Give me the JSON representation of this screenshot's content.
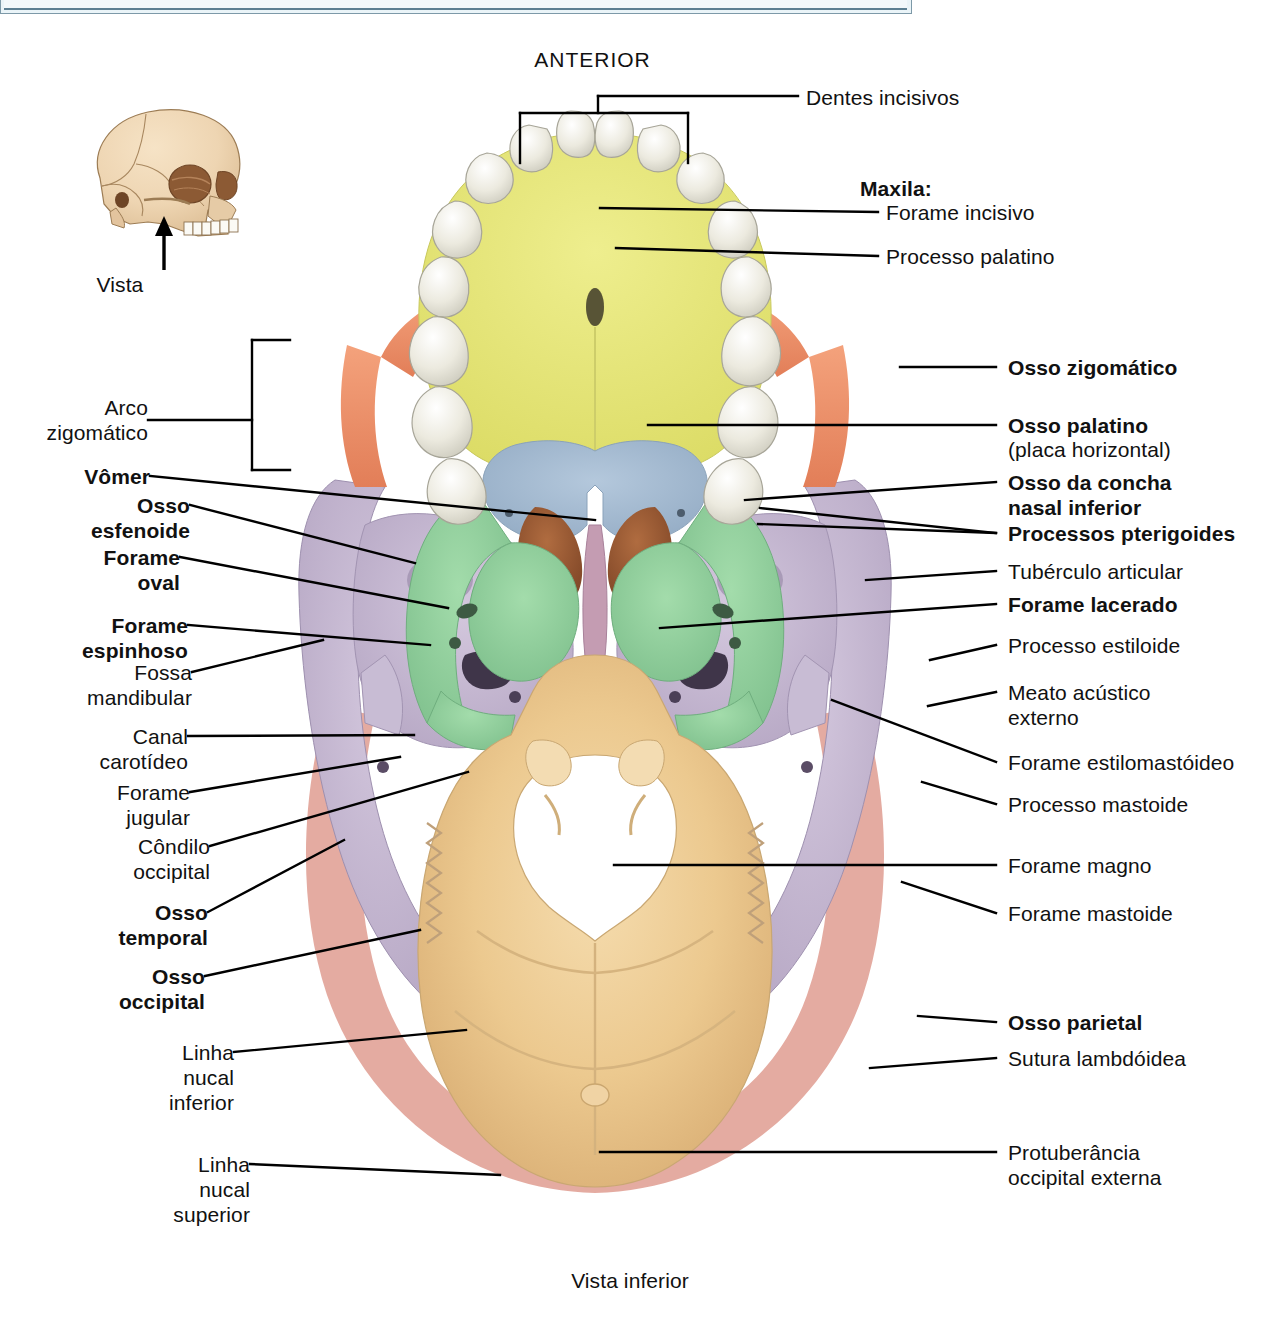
{
  "figure": {
    "orientation_label": "ANTERIOR",
    "caption": "Vista inferior",
    "inset_label": "Vista"
  },
  "colors": {
    "maxilla": "#e8e87a",
    "palatine": "#a7bcd2",
    "sphenoid": "#8fce9a",
    "concha_nasal": "#9c5a33",
    "vomer": "#c59ab0",
    "temporal": "#c3b6ce",
    "occipital": "#eccf95",
    "zygomatic": "#ef8e68",
    "parietal": "#e2a59a",
    "teeth": "#e6e4da",
    "banner": "#eaf4f8",
    "banner_border": "#5c7f92"
  },
  "labels_left": [
    {
      "id": "arco-zigomatico",
      "text": "Arco\nzigomático",
      "bold": false
    },
    {
      "id": "vomer",
      "text": "Vômer",
      "bold": true
    },
    {
      "id": "osso-esfenoide",
      "text": "Osso\nesfenoide",
      "bold": true
    },
    {
      "id": "forame-oval",
      "text": "Forame\noval",
      "bold": true
    },
    {
      "id": "forame-espinhoso",
      "text": "Forame\nespinhoso",
      "bold": true
    },
    {
      "id": "fossa-mandibular",
      "text": "Fossa\nmandibular",
      "bold": false
    },
    {
      "id": "canal-carotideo",
      "text": "Canal\ncarotídeo",
      "bold": false
    },
    {
      "id": "forame-jugular",
      "text": "Forame\njugular",
      "bold": false
    },
    {
      "id": "condilo-occipital",
      "text": "Côndilo\noccipital",
      "bold": false
    },
    {
      "id": "osso-temporal",
      "text": "Osso\ntemporal",
      "bold": true
    },
    {
      "id": "osso-occipital",
      "text": "Osso\noccipital",
      "bold": true
    },
    {
      "id": "linha-nucal-inferior",
      "text": "Linha\nnucal\ninferior",
      "bold": false
    },
    {
      "id": "linha-nucal-superior",
      "text": "Linha\nnucal\nsuperior",
      "bold": false
    }
  ],
  "labels_right": [
    {
      "id": "dentes-incisivos",
      "text": "Dentes incisivos",
      "bold": false
    },
    {
      "id": "maxila",
      "text": "Maxila:",
      "bold": true
    },
    {
      "id": "forame-incisivo",
      "text": "Forame incisivo",
      "bold": false
    },
    {
      "id": "processo-palatino",
      "text": "Processo palatino",
      "bold": false
    },
    {
      "id": "osso-zigomatico",
      "text": "Osso zigomático",
      "bold": true
    },
    {
      "id": "osso-palatino",
      "text": "Osso palatino",
      "bold": true
    },
    {
      "id": "osso-palatino-sub",
      "text": "(placa horizontal)",
      "bold": false
    },
    {
      "id": "osso-concha-nasal-inferior",
      "text": "Osso da concha\nnasal inferior",
      "bold": true
    },
    {
      "id": "processos-pterigoides",
      "text": "Processos pterigoides",
      "bold": true
    },
    {
      "id": "tuberculo-articular",
      "text": "Tubérculo articular",
      "bold": false
    },
    {
      "id": "forame-lacerado",
      "text": "Forame lacerado",
      "bold": true
    },
    {
      "id": "processo-estiloide",
      "text": "Processo estiloide",
      "bold": false
    },
    {
      "id": "meato-acustico-externo",
      "text": "Meato acústico\nexterno",
      "bold": false
    },
    {
      "id": "forame-estilomastoideo",
      "text": "Forame estilomastóideo",
      "bold": false
    },
    {
      "id": "processo-mastoide",
      "text": "Processo mastoide",
      "bold": false
    },
    {
      "id": "forame-magno",
      "text": "Forame magno",
      "bold": false
    },
    {
      "id": "forame-mastoide",
      "text": "Forame mastoide",
      "bold": false
    },
    {
      "id": "osso-parietal",
      "text": "Osso parietal",
      "bold": true
    },
    {
      "id": "sutura-lambdoidea",
      "text": "Sutura lambdóidea",
      "bold": false
    },
    {
      "id": "protuberancia-occipital-externa",
      "text": "Protuberância\noccipital externa",
      "bold": false
    }
  ],
  "text": {
    "anterior": "ANTERIOR",
    "vista": "Vista",
    "vista_inferior": "Vista inferior",
    "arco_zigomatico": "Arco\nzigomático",
    "vomer": "Vômer",
    "osso_esfenoide": "Osso\nesfenoide",
    "forame_oval": "Forame\noval",
    "forame_espinhoso": "Forame\nespinhoso",
    "fossa_mandibular": "Fossa\nmandibular",
    "canal_carotideo": "Canal\ncarotídeo",
    "forame_jugular": "Forame\njugular",
    "condilo_occipital": "Côndilo\noccipital",
    "osso_temporal": "Osso\ntemporal",
    "osso_occipital": "Osso\noccipital",
    "linha_nucal_inferior": "Linha\nnucal\ninferior",
    "linha_nucal_superior": "Linha\nnucal\nsuperior",
    "dentes_incisivos": "Dentes incisivos",
    "maxila": "Maxila:",
    "forame_incisivo": "Forame incisivo",
    "processo_palatino": "Processo palatino",
    "osso_zigomatico": "Osso zigomático",
    "osso_palatino": "Osso palatino",
    "osso_palatino_sub": "(placa horizontal)",
    "osso_concha_nasal_inferior": "Osso da concha\nnasal inferior",
    "processos_pterigoides": "Processos pterigoides",
    "tuberculo_articular": "Tubérculo articular",
    "forame_lacerado": "Forame lacerado",
    "processo_estiloide": "Processo estiloide",
    "meato_acustico_externo": "Meato acústico\nexterno",
    "forame_estilomastoideo": "Forame estilomastóideo",
    "processo_mastoide": "Processo mastoide",
    "forame_magno": "Forame magno",
    "forame_mastoide": "Forame mastoide",
    "osso_parietal": "Osso parietal",
    "sutura_lambdoidea": "Sutura lambdóidea",
    "protuberancia_occipital_externa": "Protuberância\noccipital externa"
  }
}
